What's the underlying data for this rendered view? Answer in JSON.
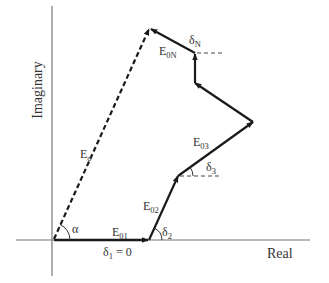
{
  "diagram": {
    "type": "phasor-diagram",
    "axes": {
      "x_label": "Real",
      "y_label": "Imaginary",
      "color": "#777777"
    },
    "colors": {
      "vector": "#1a1a1a",
      "text": "#333333",
      "reference_dash": "#444444"
    },
    "resultant": {
      "name": "E",
      "sub": "o",
      "style": "dashed"
    },
    "angle_alpha": "α",
    "vectors": [
      {
        "name": "E",
        "sub": "01",
        "angle_name": "δ",
        "angle_sub": "1",
        "angle_value": " = 0"
      },
      {
        "name": "E",
        "sub": "02",
        "angle_name": "δ",
        "angle_sub": "2"
      },
      {
        "name": "E",
        "sub": "03",
        "angle_name": "δ",
        "angle_sub": "3"
      },
      {
        "name": "E",
        "sub": "0N",
        "angle_name": "δ",
        "angle_sub": "N"
      }
    ]
  }
}
